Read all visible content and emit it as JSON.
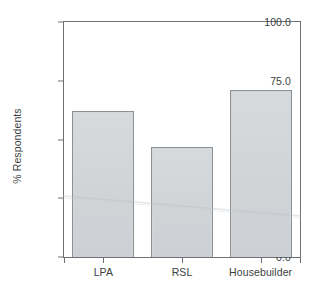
{
  "chart_data": {
    "type": "bar",
    "title": "",
    "subtitle": "",
    "xlabel": "",
    "ylabel": "% Respondents",
    "categories": [
      "LPA",
      "RSL",
      "Housebuilder"
    ],
    "values": [
      62,
      47,
      71
    ],
    "series": [
      {
        "name": "% Respondents",
        "values": [
          62,
          47,
          71
        ]
      }
    ],
    "ylim": [
      0.0,
      100.0
    ],
    "y_ticks": [
      0.0,
      25.0,
      50.0,
      75.0,
      100.0
    ],
    "y_tick_labels": [
      "0.0",
      "25.0",
      "50.0",
      "75.0",
      "100.0"
    ],
    "grid": false,
    "legend": false,
    "legend_position": "none",
    "annotations": []
  },
  "style": {
    "bar_fill": "#d2d6d9",
    "bar_edge": "#8c9196",
    "axis_color": "#6e7276",
    "text_color": "#3c3f42",
    "background": "#ffffff"
  }
}
